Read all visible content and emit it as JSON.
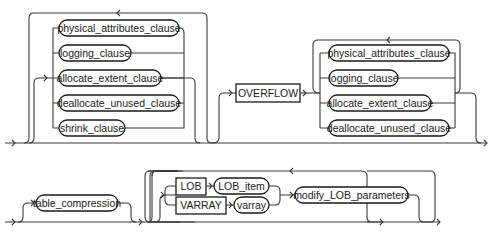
{
  "diagram": {
    "type": "railroad-syntax-diagram",
    "colors": {
      "line": "#3a3a3a",
      "text": "#1a1a1a",
      "background": "#ffffff"
    },
    "row1": {
      "group1": {
        "items": [
          "physical_attributes_clause",
          "logging_clause",
          "allocate_extent_clause",
          "deallocate_unused_clause",
          "shrink_clause"
        ]
      },
      "overflow_keyword": "OVERFLOW",
      "group2": {
        "items": [
          "physical_attributes_clause",
          "logging_clause",
          "allocate_extent_clause",
          "deallocate_unused_clause"
        ]
      }
    },
    "row2": {
      "table_compression": "table_compression",
      "lob_keyword": "LOB",
      "lob_item": "LOB_item",
      "varray_keyword": "VARRAY",
      "varray": "varray",
      "modify_lob_parameters": "modify_LOB_parameters"
    }
  }
}
